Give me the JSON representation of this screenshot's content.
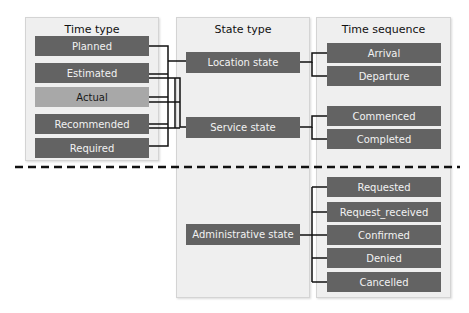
{
  "panels": {
    "time_type": {
      "title": "Time type",
      "items": [
        "Planned",
        "Estimated",
        "Actual",
        "Recommended",
        "Required"
      ]
    },
    "state_type": {
      "title": "State type",
      "items": [
        "Location state",
        "Service state",
        "Administrative state"
      ]
    },
    "time_sequence": {
      "title": "Time sequence",
      "items": [
        "Arrival",
        "Departure",
        "Commenced",
        "Completed",
        "Requested",
        "Request_received",
        "Confirmed",
        "Denied",
        "Cancelled"
      ]
    }
  },
  "colors": {
    "box_dark": "#636363",
    "box_highlight": "#a8a8a8",
    "panel_bg": "#efefef",
    "divider": "#111111"
  }
}
